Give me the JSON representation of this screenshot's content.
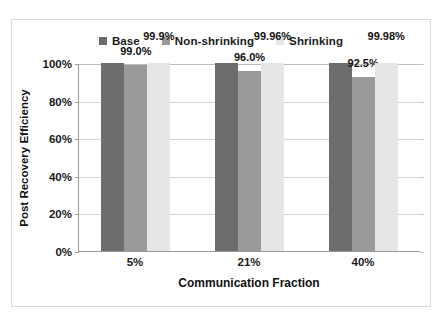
{
  "chart_data": {
    "type": "bar",
    "title": "",
    "subtitle": "",
    "xlabel": "Communication Fraction",
    "ylabel": "Post Recovery Efficiency",
    "categories": [
      "5%",
      "21%",
      "40%"
    ],
    "series": [
      {
        "name": "Base",
        "color": "#6d6d6d",
        "values": [
          100,
          100,
          100
        ],
        "data_labels": [
          "",
          "",
          ""
        ]
      },
      {
        "name": "Non-shrinking",
        "color": "#9a9a9a",
        "values": [
          99.0,
          96.0,
          92.5
        ],
        "data_labels": [
          "99.0%",
          "96.0%",
          "92.5%"
        ]
      },
      {
        "name": "Shrinking",
        "color": "#e6e6e6",
        "values": [
          99.9,
          99.96,
          99.98
        ],
        "data_labels": [
          "99.9%",
          "99.96%",
          "99.98%"
        ]
      }
    ],
    "ylim": [
      0,
      100
    ],
    "yticks": [
      0,
      20,
      40,
      60,
      80,
      100
    ],
    "ytick_labels": [
      "0%",
      "20%",
      "40%",
      "60%",
      "80%",
      "100%"
    ],
    "grid": true,
    "grid_color": "#d6d6d6",
    "legend_position": "top",
    "axis_color": "#9a9a9a",
    "background": "#ffffff"
  }
}
